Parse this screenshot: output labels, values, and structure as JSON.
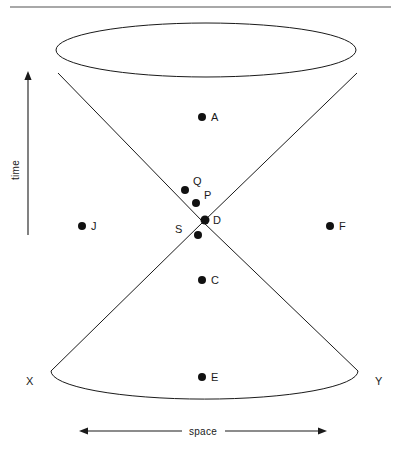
{
  "figure": {
    "type": "light-cone-spacetime-diagram",
    "background_color": "#ffffff",
    "line_color": "#1a1a1a",
    "dot_color": "#111111",
    "rule_color": "#a8a8a8"
  },
  "axes": {
    "vertical": {
      "label": "time",
      "direction": "up",
      "x": 28,
      "y_from": 235,
      "y_to": 73,
      "label_x": 19,
      "label_y": 170
    },
    "horizontal": {
      "label": "space",
      "direction": "both",
      "y": 431,
      "x_from": 80,
      "x_to": 326,
      "label_x": 203,
      "label_y": 434
    }
  },
  "cone": {
    "apex": {
      "x": 203,
      "y": 222
    },
    "future": {
      "ellipse": {
        "cx": 206,
        "cy": 50,
        "rx": 150,
        "ry": 27
      },
      "left_tangent": {
        "x": 58,
        "y": 73
      },
      "right_tangent": {
        "x": 357,
        "y": 73
      }
    },
    "past": {
      "ellipse": {
        "cx": 206,
        "cy": 372,
        "rx": 153,
        "ry": 28
      },
      "left_tangent": {
        "x": 51,
        "y": 371
      },
      "right_tangent": {
        "x": 358,
        "y": 371
      }
    }
  },
  "corner_labels": [
    {
      "name": "X",
      "text": "X",
      "x": 26,
      "y": 385
    },
    {
      "name": "Y",
      "text": "Y",
      "x": 375,
      "y": 385
    }
  ],
  "events": [
    {
      "id": "A",
      "label": "A",
      "dot_x": 202,
      "dot_y": 117,
      "label_x": 211,
      "label_y": 121,
      "r": 4.0
    },
    {
      "id": "Q",
      "label": "Q",
      "dot_x": 185,
      "dot_y": 190,
      "label_x": 193,
      "label_y": 185,
      "r": 4.0
    },
    {
      "id": "P",
      "label": "P",
      "dot_x": 196,
      "dot_y": 203,
      "label_x": 204,
      "label_y": 199,
      "r": 4.0
    },
    {
      "id": "D",
      "label": "D",
      "dot_x": 205,
      "dot_y": 220,
      "label_x": 213,
      "label_y": 224,
      "r": 4.5
    },
    {
      "id": "S",
      "label": "S",
      "dot_x": 198,
      "dot_y": 235,
      "label_x": 179,
      "label_y": 233,
      "r": 4.0
    },
    {
      "id": "J",
      "label": "J",
      "dot_x": 82,
      "dot_y": 226,
      "label_x": 91,
      "label_y": 230,
      "r": 4.0
    },
    {
      "id": "F",
      "label": "F",
      "dot_x": 330,
      "dot_y": 226,
      "label_x": 339,
      "label_y": 230,
      "r": 4.0
    },
    {
      "id": "C",
      "label": "C",
      "dot_x": 202,
      "dot_y": 280,
      "label_x": 211,
      "label_y": 284,
      "r": 4.0
    },
    {
      "id": "E",
      "label": "E",
      "dot_x": 202,
      "dot_y": 377,
      "label_x": 211,
      "label_y": 381,
      "r": 4.0
    }
  ]
}
